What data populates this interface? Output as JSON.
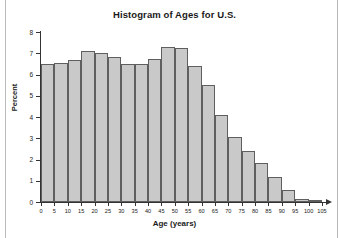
{
  "chart_data": {
    "type": "bar",
    "title": "Histogram of Ages for U.S.",
    "xlabel": "Age (years)",
    "ylabel": "Percent",
    "xlim": [
      0,
      105
    ],
    "ylim": [
      0,
      8
    ],
    "grid": false,
    "legend": "none",
    "bin_width": 5,
    "bar_fill_color": "#c9c9c9",
    "bar_border_color": "#5f5f5f",
    "xticks": [
      0,
      5,
      10,
      15,
      20,
      25,
      30,
      35,
      40,
      45,
      50,
      55,
      60,
      65,
      70,
      75,
      80,
      85,
      90,
      95,
      100,
      105
    ],
    "yticks": [
      0,
      1,
      2,
      3,
      4,
      5,
      6,
      7,
      8
    ],
    "bins": [
      {
        "start": 0,
        "end": 5,
        "label": "0-5",
        "value": 6.5
      },
      {
        "start": 5,
        "end": 10,
        "label": "5-10",
        "value": 6.55
      },
      {
        "start": 10,
        "end": 15,
        "label": "10-15",
        "value": 6.7
      },
      {
        "start": 15,
        "end": 20,
        "label": "15-20",
        "value": 7.1
      },
      {
        "start": 20,
        "end": 25,
        "label": "20-25",
        "value": 7.0
      },
      {
        "start": 25,
        "end": 30,
        "label": "25-30",
        "value": 6.82
      },
      {
        "start": 30,
        "end": 35,
        "label": "30-35",
        "value": 6.5
      },
      {
        "start": 35,
        "end": 40,
        "label": "35-40",
        "value": 6.5
      },
      {
        "start": 40,
        "end": 45,
        "label": "40-45",
        "value": 6.75
      },
      {
        "start": 45,
        "end": 50,
        "label": "45-50",
        "value": 7.3
      },
      {
        "start": 50,
        "end": 55,
        "label": "50-55",
        "value": 7.25
      },
      {
        "start": 55,
        "end": 60,
        "label": "55-60",
        "value": 6.4
      },
      {
        "start": 60,
        "end": 65,
        "label": "60-65",
        "value": 5.5
      },
      {
        "start": 65,
        "end": 70,
        "label": "65-70",
        "value": 4.1
      },
      {
        "start": 70,
        "end": 75,
        "label": "70-75",
        "value": 3.05
      },
      {
        "start": 75,
        "end": 80,
        "label": "75-80",
        "value": 2.4
      },
      {
        "start": 80,
        "end": 85,
        "label": "80-85",
        "value": 1.85
      },
      {
        "start": 85,
        "end": 90,
        "label": "85-90",
        "value": 1.2
      },
      {
        "start": 90,
        "end": 95,
        "label": "90-95",
        "value": 0.55
      },
      {
        "start": 95,
        "end": 100,
        "label": "95-100",
        "value": 0.15
      },
      {
        "start": 100,
        "end": 105,
        "label": "100-105",
        "value": 0.05
      }
    ]
  }
}
